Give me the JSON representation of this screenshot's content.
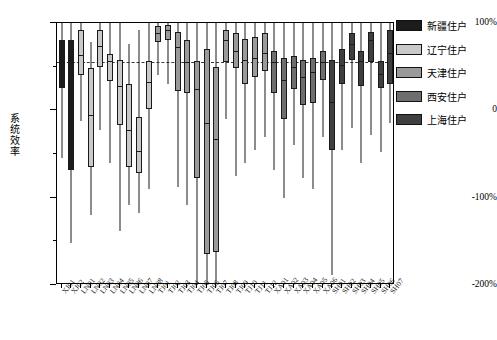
{
  "chart_data": {
    "type": "box",
    "title": "",
    "xlabel": "",
    "ylabel": "系统效率",
    "ylim": [
      -200,
      100
    ],
    "ytick_labels": [
      "100%",
      "0",
      "-100%",
      "-200%"
    ],
    "ytick_values": [
      100,
      0,
      -100,
      -200
    ],
    "grid": false,
    "reference_line": {
      "value": 55,
      "style": "dashed"
    },
    "legend": {
      "position": "right",
      "entries": [
        {
          "label": "新疆住户",
          "color": "#1c1c1c",
          "key": "XJ"
        },
        {
          "label": "辽宁住户",
          "color": "#c9c9c9",
          "key": "LN"
        },
        {
          "label": "天津住户",
          "color": "#9a9a9a",
          "key": "TJ"
        },
        {
          "label": "西安住户",
          "color": "#6e6e6e",
          "key": "XA"
        },
        {
          "label": "上海住户",
          "color": "#3f3f3f",
          "key": "SH"
        }
      ]
    },
    "categories": [
      "XJ01",
      "XJ02",
      "LN01",
      "LN02",
      "LN03",
      "LN04",
      "LN05",
      "LN06",
      "LN07",
      "LN08",
      "TJ01",
      "TJ02",
      "TJ03",
      "TJ04",
      "TJ05",
      "TJ06",
      "TJ07",
      "TJ08",
      "TJ09",
      "TJ10",
      "TJ11",
      "TJ12",
      "XA01",
      "XA02",
      "XA03",
      "XA04",
      "XA05",
      "XA06",
      "SH01",
      "SH02",
      "SH03",
      "SH04",
      "SH05",
      "SH06",
      "SH07"
    ],
    "boxes": [
      {
        "label": "XJ01",
        "group": "XJ",
        "whisker_low": -55,
        "q1": 26,
        "median": 52,
        "q3": 80,
        "whisker_high": 100
      },
      {
        "label": "XJ02",
        "group": "XJ",
        "whisker_low": -152,
        "q1": -68,
        "median": 45,
        "q3": 80,
        "whisker_high": 100
      },
      {
        "label": "LN01",
        "group": "LN",
        "whisker_low": -12,
        "q1": 40,
        "median": 63,
        "q3": 92,
        "whisker_high": 100
      },
      {
        "label": "LN02",
        "group": "LN",
        "whisker_low": -120,
        "q1": -65,
        "median": -5,
        "q3": 48,
        "whisker_high": 78
      },
      {
        "label": "LN03",
        "group": "LN",
        "whisker_low": -22,
        "q1": 50,
        "median": 74,
        "q3": 92,
        "whisker_high": 100
      },
      {
        "label": "LN04",
        "group": "LN",
        "whisker_low": -60,
        "q1": 34,
        "median": 56,
        "q3": 64,
        "whisker_high": 100
      },
      {
        "label": "LN05",
        "group": "LN",
        "whisker_low": -138,
        "q1": -17,
        "median": 28,
        "q3": 58,
        "whisker_high": 100
      },
      {
        "label": "LN06",
        "group": "LN",
        "whisker_low": -108,
        "q1": -65,
        "median": -22,
        "q3": 30,
        "whisker_high": 76
      },
      {
        "label": "LN07",
        "group": "LN",
        "whisker_low": -118,
        "q1": -72,
        "median": -46,
        "q3": -8,
        "whisker_high": 92
      },
      {
        "label": "LN08",
        "group": "LN",
        "whisker_low": -90,
        "q1": 2,
        "median": 32,
        "q3": 56,
        "whisker_high": 100
      },
      {
        "label": "TJ01",
        "group": "TJ",
        "whisker_low": 40,
        "q1": 78,
        "median": 88,
        "q3": 96,
        "whisker_high": 100
      },
      {
        "label": "TJ02",
        "group": "TJ",
        "whisker_low": 30,
        "q1": 80,
        "median": 92,
        "q3": 98,
        "whisker_high": 100
      },
      {
        "label": "TJ03",
        "group": "TJ",
        "whisker_low": -88,
        "q1": 22,
        "median": 72,
        "q3": 90,
        "whisker_high": 100
      },
      {
        "label": "TJ04",
        "group": "TJ",
        "whisker_low": -108,
        "q1": 20,
        "median": 55,
        "q3": 80,
        "whisker_high": 100
      },
      {
        "label": "TJ05",
        "group": "TJ",
        "whisker_low": -200,
        "q1": -78,
        "median": 24,
        "q3": 56,
        "whisker_high": 100
      },
      {
        "label": "TJ06",
        "group": "TJ",
        "whisker_low": -205,
        "q1": -165,
        "median": -15,
        "q3": 70,
        "whisker_high": 100
      },
      {
        "label": "TJ07",
        "group": "TJ",
        "whisker_low": -198,
        "q1": -162,
        "median": -33,
        "q3": 50,
        "whisker_high": 100
      },
      {
        "label": "TJ08",
        "group": "TJ",
        "whisker_low": -10,
        "q1": 55,
        "median": 80,
        "q3": 92,
        "whisker_high": 100
      },
      {
        "label": "TJ09",
        "group": "TJ",
        "whisker_low": -75,
        "q1": 48,
        "median": 68,
        "q3": 88,
        "whisker_high": 100
      },
      {
        "label": "TJ10",
        "group": "TJ",
        "whisker_low": -60,
        "q1": 30,
        "median": 58,
        "q3": 82,
        "whisker_high": 100
      },
      {
        "label": "TJ11",
        "group": "TJ",
        "whisker_low": -45,
        "q1": 38,
        "median": 60,
        "q3": 84,
        "whisker_high": 100
      },
      {
        "label": "TJ12",
        "group": "TJ",
        "whisker_low": -30,
        "q1": 45,
        "median": 66,
        "q3": 88,
        "whisker_high": 100
      },
      {
        "label": "XA01",
        "group": "XA",
        "whisker_low": -68,
        "q1": 20,
        "median": 55,
        "q3": 68,
        "whisker_high": 100
      },
      {
        "label": "XA02",
        "group": "XA",
        "whisker_low": -100,
        "q1": -10,
        "median": 35,
        "q3": 60,
        "whisker_high": 100
      },
      {
        "label": "XA03",
        "group": "XA",
        "whisker_low": -40,
        "q1": 24,
        "median": 50,
        "q3": 62,
        "whisker_high": 100
      },
      {
        "label": "XA04",
        "group": "XA",
        "whisker_low": -78,
        "q1": 6,
        "median": 38,
        "q3": 58,
        "whisker_high": 100
      },
      {
        "label": "XA05",
        "group": "XA",
        "whisker_low": -90,
        "q1": 8,
        "median": 44,
        "q3": 60,
        "whisker_high": 100
      },
      {
        "label": "XA06",
        "group": "XA",
        "whisker_low": -30,
        "q1": 35,
        "median": 55,
        "q3": 68,
        "whisker_high": 100
      },
      {
        "label": "SH01",
        "group": "SH",
        "whisker_low": -188,
        "q1": -45,
        "median": 10,
        "q3": 58,
        "whisker_high": 100
      },
      {
        "label": "SH02",
        "group": "SH",
        "whisker_low": -45,
        "q1": 30,
        "median": 52,
        "q3": 70,
        "whisker_high": 100
      },
      {
        "label": "SH03",
        "group": "SH",
        "whisker_low": -20,
        "q1": 58,
        "median": 76,
        "q3": 88,
        "whisker_high": 100
      },
      {
        "label": "SH04",
        "group": "SH",
        "whisker_low": -60,
        "q1": 28,
        "median": 56,
        "q3": 68,
        "whisker_high": 100
      },
      {
        "label": "SH05",
        "group": "SH",
        "whisker_low": -28,
        "q1": 55,
        "median": 80,
        "q3": 90,
        "whisker_high": 100
      },
      {
        "label": "SH06",
        "group": "SH",
        "whisker_low": -48,
        "q1": 26,
        "median": 42,
        "q3": 56,
        "whisker_high": 100
      },
      {
        "label": "SH07",
        "group": "SH",
        "whisker_low": -15,
        "q1": 30,
        "median": 66,
        "q3": 92,
        "whisker_high": 100
      }
    ]
  }
}
